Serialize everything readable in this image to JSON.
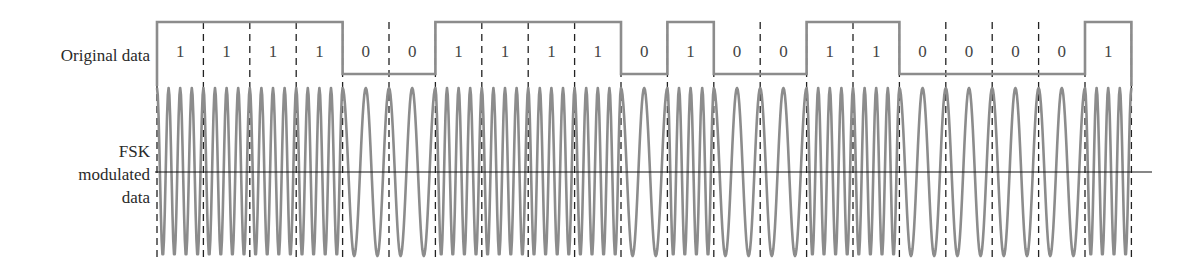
{
  "labels": {
    "original_data": "Original data",
    "fsk_line1": "FSK",
    "fsk_line2": "modulated",
    "fsk_line3": "data"
  },
  "colors": {
    "signal": "#8c8c8c",
    "dashed": "#222222",
    "axis": "#111111",
    "text": "#2a2a2a"
  },
  "chart_data": {
    "type": "line",
    "title": "",
    "bits": [
      1,
      1,
      1,
      1,
      0,
      0,
      1,
      1,
      1,
      1,
      0,
      1,
      0,
      0,
      1,
      1,
      0,
      0,
      0,
      0,
      1
    ],
    "series": [
      {
        "name": "Original data",
        "kind": "square",
        "values": [
          1,
          1,
          1,
          1,
          0,
          0,
          1,
          1,
          1,
          1,
          0,
          1,
          0,
          0,
          1,
          1,
          0,
          0,
          0,
          0,
          1
        ]
      },
      {
        "name": "FSK modulated data",
        "kind": "sinusoid",
        "cycles_per_bit": {
          "1": 4,
          "0": 2
        }
      }
    ],
    "layout": {
      "x_start": 157,
      "bit_width": 46.4,
      "digital_high_y": 22,
      "digital_low_y": 74,
      "wave_center_y": 172,
      "wave_amplitude": 84,
      "axis_x_end": 1152,
      "dashed_top": 22,
      "dashed_bottom": 258
    },
    "xlabel": "",
    "ylabel": ""
  }
}
